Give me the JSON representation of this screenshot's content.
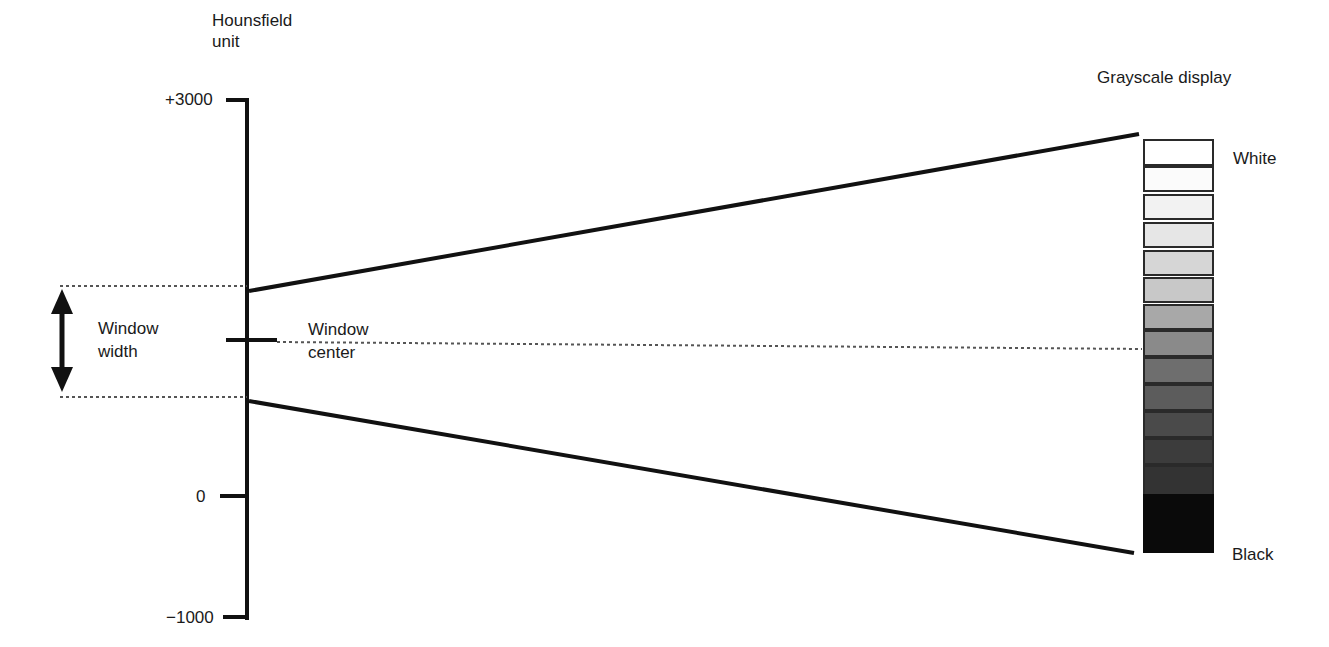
{
  "axis": {
    "title_line1": "Hounsfield",
    "title_line2": "unit",
    "ticks": [
      {
        "label": "+3000",
        "value": 3000
      },
      {
        "label": "0",
        "value": 0
      },
      {
        "label": "−1000",
        "value": -1000
      }
    ]
  },
  "window": {
    "width_label_line1": "Window",
    "width_label_line2": "width",
    "center_label_line1": "Window",
    "center_label_line2": "center"
  },
  "grayscale": {
    "title": "Grayscale display",
    "top_label": "White",
    "bottom_label": "Black",
    "levels": [
      "#ffffff",
      "#fbfbfb",
      "#f2f2f2",
      "#e6e6e6",
      "#d6d6d6",
      "#c8c8c8",
      "#a8a8a8",
      "#8a8a8a",
      "#6e6e6e",
      "#5c5c5c",
      "#4a4a4a",
      "#3c3c3c",
      "#333333",
      "#0a0a0a"
    ]
  }
}
